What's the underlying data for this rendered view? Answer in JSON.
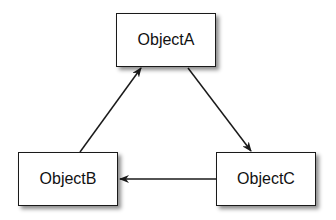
{
  "diagram": {
    "nodes": [
      {
        "id": "A",
        "label": "ObjectA"
      },
      {
        "id": "B",
        "label": "ObjectB"
      },
      {
        "id": "C",
        "label": "ObjectC"
      }
    ],
    "edges": [
      {
        "from": "B",
        "to": "A"
      },
      {
        "from": "A",
        "to": "C"
      },
      {
        "from": "C",
        "to": "B"
      }
    ],
    "colors": {
      "stroke": "#1a1a1a",
      "background": "#ffffff"
    }
  }
}
